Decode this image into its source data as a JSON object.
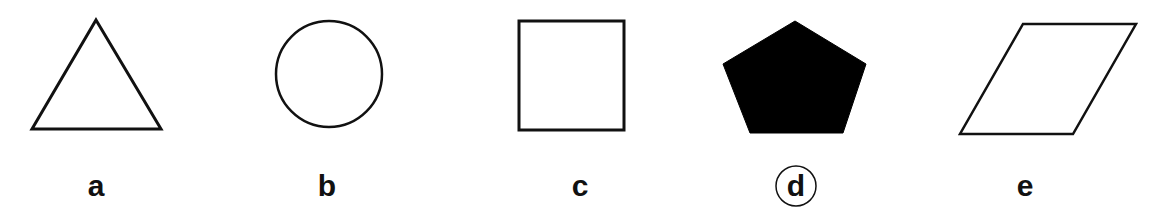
{
  "figure": {
    "background": "#ffffff",
    "stroke_color": "#111111",
    "fill_color": "#000000",
    "options": [
      {
        "label": "a",
        "shape": "triangle",
        "filled": false,
        "circled": false
      },
      {
        "label": "b",
        "shape": "circle",
        "filled": false,
        "circled": false
      },
      {
        "label": "c",
        "shape": "square",
        "filled": false,
        "circled": false
      },
      {
        "label": "d",
        "shape": "pentagon",
        "filled": true,
        "circled": true
      },
      {
        "label": "e",
        "shape": "parallelogram",
        "filled": false,
        "circled": false
      }
    ]
  }
}
